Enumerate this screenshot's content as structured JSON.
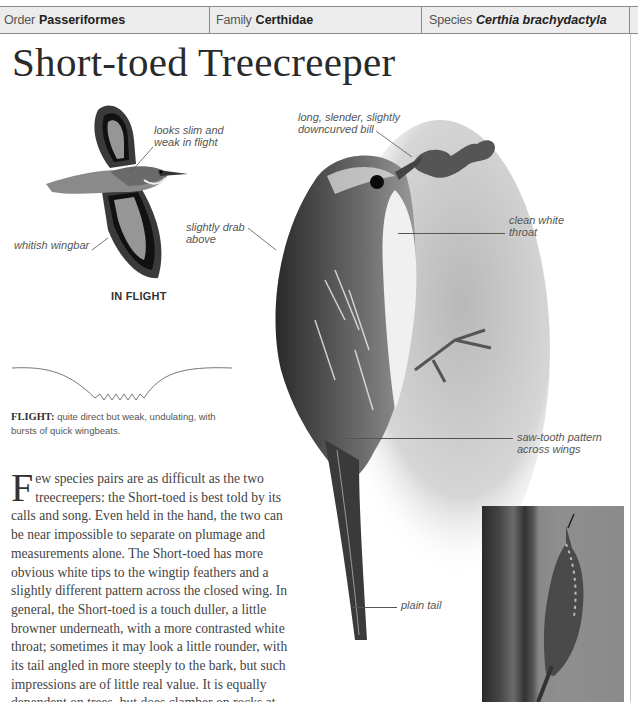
{
  "taxonomy": {
    "order_label": "Order",
    "order_value": "Passeriformes",
    "family_label": "Family",
    "family_value": "Certhidae",
    "species_label": "Species",
    "species_value": "Certhia brachydactyla"
  },
  "title": "Short-toed Treecreeper",
  "flight_illustration": {
    "caption": "IN FLIGHT",
    "annotations": [
      {
        "text_line1": "looks slim and",
        "text_line2": "weak in flight"
      },
      {
        "text_line1": "whitish wingbar",
        "text_line2": ""
      }
    ]
  },
  "main_illustration": {
    "annotations": [
      {
        "text_line1": "slightly drab",
        "text_line2": "above"
      },
      {
        "text_line1": "long, slender, slightly",
        "text_line2": "downcurved bill"
      },
      {
        "text_line1": "clean white",
        "text_line2": "throat"
      },
      {
        "text_line1": "saw-tooth pattern",
        "text_line2": "across wings"
      },
      {
        "text_line1": "plain tail",
        "text_line2": ""
      }
    ]
  },
  "flight": {
    "label": "FLIGHT:",
    "description": " quite direct but weak, undulating, with bursts of quick wingbeats."
  },
  "description": {
    "drop_cap": "F",
    "text": "ew species pairs are as difficult as the two treecreepers: the Short-toed is best told by its calls and song. Even held in the hand, the two can be near impossible to separate on plumage and measurements alone. The Short-toed has more obvious white tips to the wingtip feathers and a slightly different pattern across the closed wing. In general, the Short-toed is a touch duller, a little browner underneath, with a more contrasted white throat; sometimes it may look a little rounder, with its tail angled in more steeply to the bark, but such impressions are of little real value. It is equally dependent on trees, but does clamber on rocks at times."
  },
  "photo": {
    "subject": "treecreeper-on-tree-trunk-photo"
  },
  "colors": {
    "header_bg": "#ececec",
    "header_border": "#8a8a8a",
    "title_text": "#2a2a2a",
    "annotation_text": "#555555"
  }
}
